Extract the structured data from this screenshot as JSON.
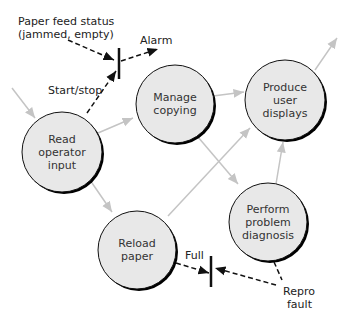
{
  "diagram": {
    "type": "data-flow",
    "colors": {
      "node_fill": "#e8e8e8",
      "node_stroke": "#111111",
      "shadow": "#000000",
      "flow": "#c4c4c4",
      "control": "#111111"
    },
    "nodes": [
      {
        "id": "read",
        "label": "Read\noperator\ninput",
        "cx": 62,
        "cy": 152,
        "r": 40
      },
      {
        "id": "manage",
        "label": "Manage\ncopying",
        "cx": 175,
        "cy": 104,
        "r": 39
      },
      {
        "id": "produce",
        "label": "Produce\nuser\ndisplays",
        "cx": 285,
        "cy": 100,
        "r": 40
      },
      {
        "id": "perform",
        "label": "Perform\nproblem\ndiagnosis",
        "cx": 268,
        "cy": 222,
        "r": 39
      },
      {
        "id": "reload",
        "label": "Reload\npaper",
        "cx": 137,
        "cy": 250,
        "r": 39
      }
    ],
    "labels": {
      "paper_feed": "Paper feed status",
      "paper_feed_2": "(jammed, empty)",
      "alarm": "Alarm",
      "start_stop": "Start/stop",
      "full": "Full",
      "repro": "Repro",
      "fault": "fault"
    }
  }
}
